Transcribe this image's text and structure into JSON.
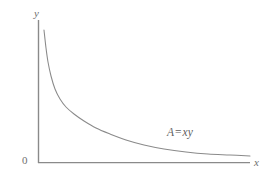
{
  "figure": {
    "background_color": "#ffffff",
    "axis_color": "#8a8a8a",
    "curve_color": "#8a8a8a",
    "text_color": "#6f6f6f"
  },
  "labels": {
    "y_axis": "y",
    "x_axis": "x",
    "origin": "0"
  },
  "annotation": {
    "lhs": "A",
    "operator": "=",
    "rhs": "xy",
    "full": "A = xy"
  },
  "chart_data": {
    "type": "line",
    "title": "",
    "xlabel": "x",
    "ylabel": "y",
    "grid": false,
    "legend": null,
    "annotations": [
      {
        "text": "A = xy",
        "x": 167,
        "y": 127
      }
    ],
    "axis_ranges": {
      "x_pixels": [
        38,
        250
      ],
      "y_pixels": [
        20,
        163
      ]
    },
    "equation": "A = xy",
    "series": [
      {
        "name": "A = xy",
        "points_px": [
          [
            44,
            30
          ],
          [
            46,
            48
          ],
          [
            48,
            62
          ],
          [
            51,
            76
          ],
          [
            55,
            89
          ],
          [
            60,
            99
          ],
          [
            66,
            107
          ],
          [
            74,
            114
          ],
          [
            84,
            121
          ],
          [
            96,
            128
          ],
          [
            110,
            134
          ],
          [
            126,
            140
          ],
          [
            144,
            145
          ],
          [
            164,
            149
          ],
          [
            186,
            152
          ],
          [
            208,
            154
          ],
          [
            230,
            155
          ],
          [
            250,
            156
          ]
        ]
      }
    ]
  }
}
